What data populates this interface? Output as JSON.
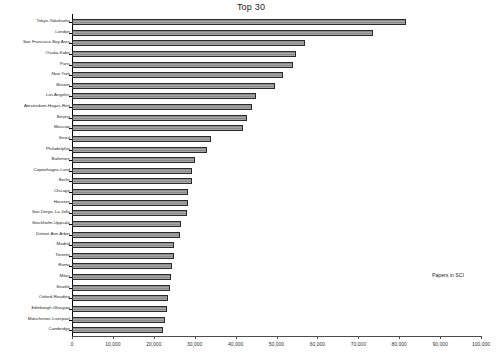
{
  "chart_data": {
    "type": "bar",
    "orientation": "horizontal",
    "title": "Top 30",
    "xlabel": "Papers in SCI",
    "ylabel": "",
    "xlim": [
      0,
      100000
    ],
    "grid": false,
    "legend": null,
    "xticks": [
      0,
      10000,
      20000,
      30000,
      40000,
      50000,
      60000,
      70000,
      80000,
      90000,
      100000
    ],
    "xticklabels": [
      "0",
      "10,000",
      "20,000",
      "30,000",
      "40,000",
      "50,000",
      "60,000",
      "70,000",
      "80,000",
      "90,000",
      "100,000"
    ],
    "categories": [
      "Tokyo-Yokohama",
      "London",
      "San Francisco Bay Area",
      "Osaka-Kobe",
      "Paris",
      "New York",
      "Boston",
      "Los Angeles",
      "Amsterdam-Hagus-Rott",
      "Beijing",
      "Moscow",
      "Seoul",
      "Philadelphia",
      "Baltimore",
      "Copenhagen-Lund",
      "Berlin",
      "Chicago",
      "Houston",
      "San Diego, La Jolla",
      "Stockholm-Uppsala",
      "Detroit-Ann Arbor",
      "Madrid",
      "Toronto",
      "Roma",
      "Milan",
      "Seattle",
      "Oxford-Reading",
      "Edinburgh-Glasgow",
      "Manchester-Liverpool",
      "Cambridge"
    ],
    "values": [
      81700,
      73600,
      57000,
      54700,
      54000,
      51500,
      49600,
      45000,
      44000,
      42800,
      41800,
      34000,
      33000,
      30000,
      29400,
      29300,
      28400,
      28300,
      28200,
      26600,
      26500,
      25000,
      24900,
      24500,
      24200,
      24000,
      23500,
      23200,
      22700,
      22300
    ],
    "bar_fill_color": "#a6a6a6",
    "bar_edge_color": "#2b2b2b",
    "background_color": "#ffffff"
  }
}
